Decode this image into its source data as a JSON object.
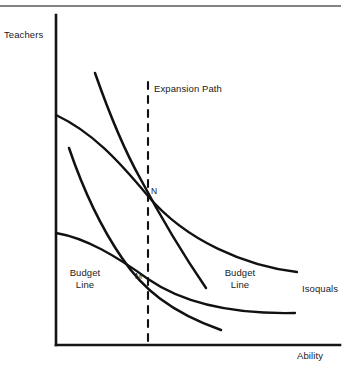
{
  "figure": {
    "type": "economics-isoquant-diagram",
    "axes": {
      "y_label": "Teachers",
      "x_label": "Ability",
      "origin": [
        56,
        345
      ],
      "x_axis_end": [
        340,
        345
      ],
      "y_axis_top": [
        56,
        15
      ]
    },
    "labels": {
      "expansion_path": "Expansion Path",
      "budget_line_left": "Budget\nLine",
      "budget_line_right": "Budget\nLine",
      "isoquals": "Isoquals",
      "point_n": "N",
      "point_m": "M"
    },
    "colors": {
      "ink": "#1a1a1a",
      "curve": "#111111",
      "background": "#ffffff",
      "rule": "#555555"
    }
  },
  "chart_data": {
    "type": "line",
    "title": "",
    "xlabel": "Ability",
    "ylabel": "Teachers",
    "grid": false,
    "legend": "none",
    "annotations": [
      {
        "text": "Expansion Path",
        "x": 154,
        "y": 89
      },
      {
        "text": "Budget Line",
        "x": 63,
        "y": 272
      },
      {
        "text": "Budget Line",
        "x": 218,
        "y": 272
      },
      {
        "text": "Isoquals",
        "x": 303,
        "y": 283
      },
      {
        "text": "N",
        "x": 151,
        "y": 188
      },
      {
        "text": "M",
        "x": 136,
        "y": 273
      }
    ],
    "series": [
      {
        "name": "Isoquant (upper)",
        "role": "isoquant",
        "style": "solid",
        "path": "M 56,115 C 92,132 118,160 148,196 C 186,241 246,266 297,272"
      },
      {
        "name": "Isoquant (lower)",
        "role": "isoquant",
        "style": "solid",
        "path": "M 56,233 C 86,238 116,256 148,279 C 190,308 248,314 295,313"
      },
      {
        "name": "Budget Line (upper, steep)",
        "role": "budget-line",
        "style": "solid",
        "path": "M 95,73 C 108,110 122,146 140,178 C 158,212 182,253 206,288"
      },
      {
        "name": "Budget Line (lower, steep)",
        "role": "budget-line",
        "style": "solid",
        "path": "M 69,148 C 82,186 100,226 122,258 C 142,288 170,312 221,330"
      },
      {
        "name": "Expansion Path",
        "role": "expansion-path",
        "style": "dashed",
        "path": "M 148,82 L 148,345"
      }
    ],
    "intersections": [
      {
        "label": "N",
        "x": 148,
        "y": 196,
        "curves": [
          "Isoquant (upper)",
          "Budget Line (upper, steep)"
        ]
      },
      {
        "label": "M",
        "x": 148,
        "y": 279,
        "curves": [
          "Isoquant (lower)",
          "Budget Line (lower, steep)"
        ]
      }
    ]
  }
}
